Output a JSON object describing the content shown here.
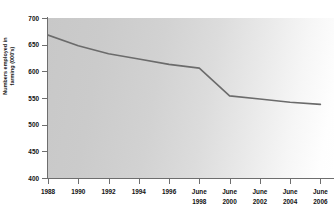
{
  "chart_data": {
    "type": "line",
    "title": "",
    "subtitle": "",
    "xlabel": "",
    "ylabel": "Numbers employed in\nfarming (000's)",
    "ylim": [
      400,
      700
    ],
    "ytick_values": [
      700,
      650,
      600,
      550,
      500,
      450,
      400
    ],
    "ytick_labels": [
      "700",
      "650",
      "600",
      "550",
      "500",
      "450",
      "400"
    ],
    "grid": false,
    "legend": false,
    "legend_position": "none",
    "line_color": "#6b6b6b",
    "background_color": "#d3d3d3",
    "categories": [
      "1988",
      "1990",
      "1992",
      "1994",
      "1996",
      "June 1998",
      "June 2000",
      "June 2002",
      "June 2004",
      "June 2006"
    ],
    "xtick_labels": [
      {
        "line1": "1988",
        "line2": ""
      },
      {
        "line1": "1990",
        "line2": ""
      },
      {
        "line1": "1992",
        "line2": ""
      },
      {
        "line1": "1994",
        "line2": ""
      },
      {
        "line1": "1996",
        "line2": ""
      },
      {
        "line1": "June",
        "line2": "1998"
      },
      {
        "line1": "June",
        "line2": "2000"
      },
      {
        "line1": "June",
        "line2": "2002"
      },
      {
        "line1": "June",
        "line2": "2004"
      },
      {
        "line1": "June",
        "line2": "2006"
      }
    ],
    "series": [
      {
        "name": "Numbers employed in farming",
        "values": [
          668,
          648,
          633,
          623,
          613,
          606,
          554,
          548,
          542,
          538
        ]
      }
    ],
    "annotations": []
  }
}
